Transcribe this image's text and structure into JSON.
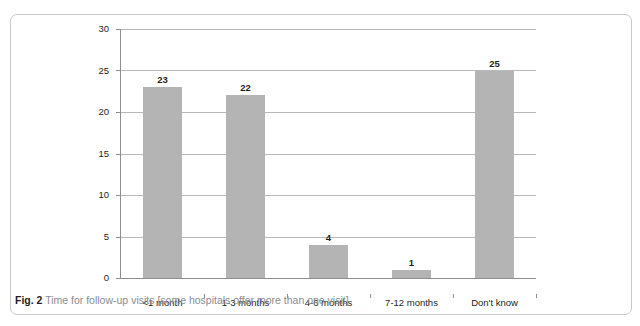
{
  "figure": {
    "caption_label": "Fig. 2",
    "caption_text": "Time for follow-up visits [some hospitals offer more than one visit]",
    "clipped_top_text": "",
    "frame_color": "#c9c9cc"
  },
  "chart_data": {
    "type": "bar",
    "title": "",
    "subtitle": "",
    "xlabel": "",
    "ylabel": "",
    "categories": [
      "<1 month",
      "1-3 months",
      "4-6 months",
      "7-12 months",
      "Don't know"
    ],
    "values": [
      23,
      22,
      4,
      1,
      25
    ],
    "value_labels": [
      "23",
      "22",
      "4",
      "1",
      "25"
    ],
    "series": [
      {
        "name": "Number of hospitals",
        "values": [
          23,
          22,
          4,
          1,
          25
        ]
      }
    ],
    "ylim": [
      0,
      30
    ],
    "ytick_values": [
      0,
      5,
      10,
      15,
      20,
      25,
      30
    ],
    "ytick_labels": [
      "0",
      "5",
      "10",
      "15",
      "20",
      "25",
      "30"
    ],
    "grid": true,
    "grid_axis": "y",
    "legend": false,
    "legend_position": "none",
    "bar_color": "#b4b4b4",
    "gridline_color": "#b8b8bb",
    "axis_color": "#8e8e91",
    "text_color": "#231f20"
  }
}
